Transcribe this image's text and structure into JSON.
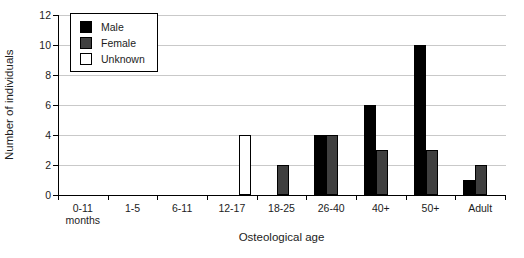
{
  "chart_data": {
    "type": "bar",
    "title": "",
    "xlabel": "Osteological age",
    "ylabel": "Number of individuals",
    "categories": [
      "0-11 months",
      "1-5",
      "6-11",
      "12-17",
      "18-25",
      "26-40",
      "40+",
      "50+",
      "Adult"
    ],
    "series": [
      {
        "name": "Male",
        "color": "#000000",
        "values": [
          0,
          0,
          0,
          0,
          0,
          4,
          6,
          10,
          1
        ]
      },
      {
        "name": "Female",
        "color": "#3f3f3f",
        "values": [
          0,
          0,
          0,
          0,
          2,
          4,
          3,
          3,
          2
        ]
      },
      {
        "name": "Unknown",
        "color": "#ffffff",
        "values": [
          0,
          0,
          0,
          4,
          0,
          0,
          0,
          0,
          0
        ]
      }
    ],
    "ylim": [
      0,
      12
    ],
    "ytick_step": 2,
    "yticks": [
      0,
      2,
      4,
      6,
      8,
      10,
      12
    ],
    "grid": true,
    "legend_position": "top-left",
    "axis_color": "#000000",
    "grid_color": "#c9c9c9",
    "bar_border_color": "#000000",
    "background_color": "#ffffff"
  }
}
